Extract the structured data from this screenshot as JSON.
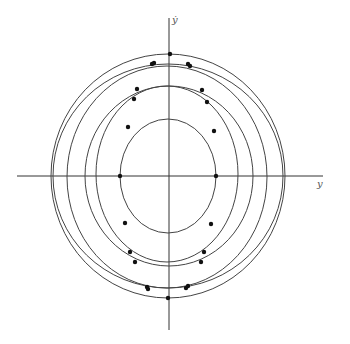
{
  "diagram": {
    "type": "phase-portrait",
    "origin": [
      169,
      176
    ],
    "axes": {
      "horizontal": {
        "label": "y",
        "from": 17,
        "to": 323
      },
      "vertical": {
        "label": "ẏ",
        "from": 18,
        "to": 330
      }
    },
    "curves": [
      {
        "name": "orbit-outer-a",
        "cx": 168,
        "cy": 176,
        "rx": 117,
        "ry": 122
      },
      {
        "name": "orbit-outer-b",
        "cx": 168,
        "cy": 176,
        "rx": 115,
        "ry": 112
      },
      {
        "name": "orbit-c",
        "cx": 167,
        "cy": 177,
        "rx": 100,
        "ry": 111
      },
      {
        "name": "orbit-d",
        "cx": 169,
        "cy": 176,
        "rx": 84,
        "ry": 90
      },
      {
        "name": "orbit-e",
        "cx": 167,
        "cy": 174,
        "rx": 71,
        "ry": 88
      },
      {
        "name": "orbit-inner",
        "cx": 168,
        "cy": 176,
        "rx": 48,
        "ry": 57
      }
    ],
    "points": [
      [
        170,
        54
      ],
      [
        152,
        64
      ],
      [
        154,
        63
      ],
      [
        188,
        64
      ],
      [
        190,
        66
      ],
      [
        137,
        89
      ],
      [
        134,
        99
      ],
      [
        202,
        90
      ],
      [
        207,
        102
      ],
      [
        128,
        127
      ],
      [
        214,
        131
      ],
      [
        120,
        176
      ],
      [
        216,
        176
      ],
      [
        125,
        223
      ],
      [
        211,
        224
      ],
      [
        130,
        252
      ],
      [
        135,
        262
      ],
      [
        204,
        252
      ],
      [
        201,
        262
      ],
      [
        147,
        287
      ],
      [
        148,
        289
      ],
      [
        186,
        288
      ],
      [
        188,
        286
      ],
      [
        168,
        298
      ]
    ]
  }
}
